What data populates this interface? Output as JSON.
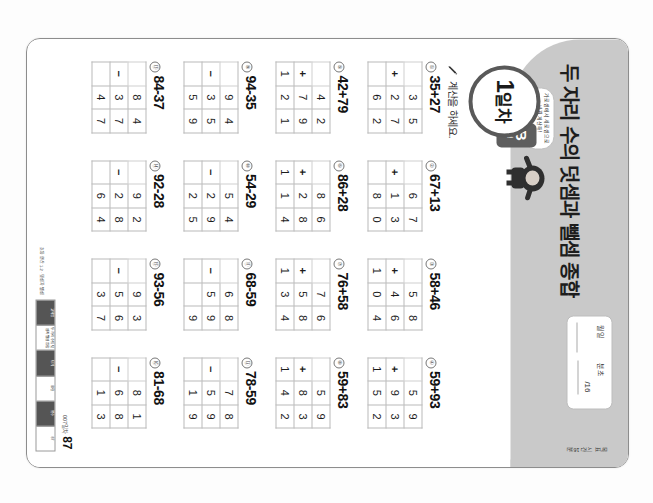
{
  "document": {
    "title": "두 자리 수의 덧셈과 뺄셈 종합",
    "day_label_number": "1",
    "day_label_word": "일차",
    "form_letter": "B",
    "form_word": "형",
    "instruction": "계산을 하세요.",
    "page_number": "87",
    "page_chapter": "007일차",
    "rotation_degrees": "90"
  },
  "datebox": {
    "label_month_day": "월      일",
    "label_min_sec": "분      초",
    "value_month_day": "",
    "value_min_sec": "/16",
    "target_note": "목표 시간 16분"
  },
  "mascot": {
    "bubble_text": "가로셈에서 세로셈으로 바꿔 계산해!"
  },
  "colors": {
    "header_band": "#c9c9c9",
    "badge_border": "#595959",
    "form_tab": "#5e5e5e",
    "grid_line": "#b9b9b9",
    "text": "#1c1c1c"
  },
  "imprint": {
    "cells": [
      "교재명",
      "두 자리 수의 덧셈과 뺄셈 종합",
      "단계",
      "B형",
      "쪽수",
      "87"
    ],
    "side_text": "초등 연산 1-2 · 덧셈과 뺄셈"
  },
  "problems": [
    {
      "n": "①",
      "expr": "35+27",
      "op": "+",
      "top": [
        "3",
        "5"
      ],
      "bottom": [
        "2",
        "7"
      ],
      "sum": [
        "",
        "6",
        "2"
      ]
    },
    {
      "n": "②",
      "expr": "67+13",
      "op": "+",
      "top": [
        "6",
        "7"
      ],
      "bottom": [
        "1",
        "3"
      ],
      "sum": [
        "",
        "8",
        "0"
      ]
    },
    {
      "n": "③",
      "expr": "58+46",
      "op": "+",
      "top": [
        "5",
        "8"
      ],
      "bottom": [
        "4",
        "6"
      ],
      "sum": [
        "1",
        "0",
        "4"
      ]
    },
    {
      "n": "④",
      "expr": "59+93",
      "op": "+",
      "top": [
        "5",
        "9"
      ],
      "bottom": [
        "9",
        "3"
      ],
      "sum": [
        "1",
        "5",
        "2"
      ]
    },
    {
      "n": "⑤",
      "expr": "42+79",
      "op": "+",
      "top": [
        "4",
        "2"
      ],
      "bottom": [
        "7",
        "9"
      ],
      "sum": [
        "1",
        "2",
        "1"
      ]
    },
    {
      "n": "⑥",
      "expr": "86+28",
      "op": "+",
      "top": [
        "8",
        "6"
      ],
      "bottom": [
        "2",
        "8"
      ],
      "sum": [
        "1",
        "1",
        "4"
      ]
    },
    {
      "n": "⑦",
      "expr": "76+58",
      "op": "+",
      "top": [
        "7",
        "6"
      ],
      "bottom": [
        "5",
        "8"
      ],
      "sum": [
        "1",
        "3",
        "4"
      ]
    },
    {
      "n": "⑧",
      "expr": "59+83",
      "op": "+",
      "top": [
        "5",
        "9"
      ],
      "bottom": [
        "8",
        "3"
      ],
      "sum": [
        "1",
        "4",
        "2"
      ]
    },
    {
      "n": "⑨",
      "expr": "94-35",
      "op": "−",
      "top": [
        "9",
        "4"
      ],
      "bottom": [
        "3",
        "5"
      ],
      "sum": [
        "",
        "5",
        "9"
      ]
    },
    {
      "n": "⑩",
      "expr": "54-29",
      "op": "−",
      "top": [
        "5",
        "4"
      ],
      "bottom": [
        "2",
        "9"
      ],
      "sum": [
        "",
        "2",
        "5"
      ]
    },
    {
      "n": "⑪",
      "expr": "68-59",
      "op": "−",
      "top": [
        "6",
        "8"
      ],
      "bottom": [
        "5",
        "9"
      ],
      "sum": [
        "",
        "",
        "9"
      ]
    },
    {
      "n": "⑫",
      "expr": "78-59",
      "op": "−",
      "top": [
        "7",
        "8"
      ],
      "bottom": [
        "5",
        "9"
      ],
      "sum": [
        "",
        "1",
        "9"
      ]
    },
    {
      "n": "⑬",
      "expr": "84-37",
      "op": "−",
      "top": [
        "8",
        "4"
      ],
      "bottom": [
        "3",
        "7"
      ],
      "sum": [
        "",
        "4",
        "7"
      ]
    },
    {
      "n": "⑭",
      "expr": "92-28",
      "op": "−",
      "top": [
        "9",
        "2"
      ],
      "bottom": [
        "2",
        "8"
      ],
      "sum": [
        "",
        "6",
        "4"
      ]
    },
    {
      "n": "⑮",
      "expr": "93-56",
      "op": "−",
      "top": [
        "9",
        "3"
      ],
      "bottom": [
        "5",
        "6"
      ],
      "sum": [
        "",
        "3",
        "7"
      ]
    },
    {
      "n": "⑯",
      "expr": "81-68",
      "op": "−",
      "top": [
        "8",
        "1"
      ],
      "bottom": [
        "6",
        "8"
      ],
      "sum": [
        "",
        "1",
        "3"
      ]
    }
  ]
}
